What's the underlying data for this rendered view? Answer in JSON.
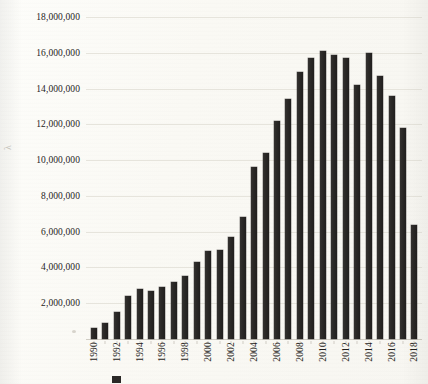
{
  "chart_data": {
    "type": "bar",
    "title": "",
    "xlabel": "",
    "ylabel": "",
    "ylim": [
      0,
      18000000
    ],
    "grid": true,
    "legend_position": "bottom",
    "y_ticks": [
      "18,000,000",
      "16,000,000",
      "14,000,000",
      "12,000,000",
      "10,000,000",
      "8,000,000",
      "6,000,000",
      "4,000,000",
      "2,000,000"
    ],
    "y_tick_values": [
      18000000,
      16000000,
      14000000,
      12000000,
      10000000,
      8000000,
      6000000,
      4000000,
      2000000
    ],
    "categories": [
      "1990",
      "1991",
      "1992",
      "1993",
      "1994",
      "1995",
      "1996",
      "1997",
      "1998",
      "1999",
      "2000",
      "2001",
      "2002",
      "2003",
      "2004",
      "2005",
      "2006",
      "2007",
      "2008",
      "2009",
      "2010",
      "2011",
      "2012",
      "2013",
      "2014",
      "2015",
      "2016",
      "2017",
      "2018"
    ],
    "x_tick_labels_shown": [
      "1990",
      "",
      "1992",
      "",
      "1994",
      "",
      "1996",
      "",
      "1998",
      "",
      "2000",
      "",
      "2002",
      "",
      "2004",
      "",
      "2006",
      "",
      "2008",
      "",
      "2010",
      "",
      "2012",
      "",
      "2014",
      "",
      "2016",
      "",
      "2018"
    ],
    "values": [
      600000,
      900000,
      1500000,
      2400000,
      2800000,
      2700000,
      2900000,
      3200000,
      3500000,
      4300000,
      4900000,
      5000000,
      5700000,
      6800000,
      9600000,
      10400000,
      12200000,
      13400000,
      14900000,
      15700000,
      16100000,
      15900000,
      15700000,
      14200000,
      16000000,
      14700000,
      13600000,
      11800000,
      6400000
    ],
    "series": [
      {
        "name": "",
        "color": "#2a2826",
        "values": [
          600000,
          900000,
          1500000,
          2400000,
          2800000,
          2700000,
          2900000,
          3200000,
          3500000,
          4300000,
          4900000,
          5000000,
          5700000,
          6800000,
          9600000,
          10400000,
          12200000,
          13400000,
          14900000,
          15700000,
          16100000,
          15900000,
          15700000,
          14200000,
          16000000,
          14700000,
          13600000,
          11800000,
          6400000
        ]
      }
    ]
  },
  "axis": {
    "y_title": "λ"
  },
  "legend": {
    "label": ""
  }
}
